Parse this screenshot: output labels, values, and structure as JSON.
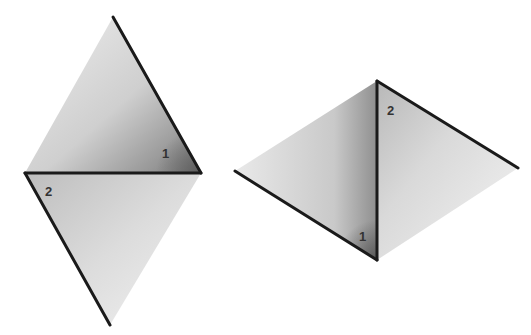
{
  "diagram": {
    "colors": {
      "edge": "#1a1a1a",
      "fill_light": "#e6e6e6",
      "fill_mid": "#c8c8c8",
      "fill_dark": "#8a8a8a",
      "label": "#333333"
    },
    "figures": [
      {
        "name": "left-rhombus",
        "vertices": {
          "top": [
            113,
            17
          ],
          "right": [
            201,
            173
          ],
          "left": [
            25,
            173
          ],
          "bottom": [
            110,
            325
          ]
        },
        "edges_drawn": [
          [
            [
              113,
              17
            ],
            [
              201,
              173
            ]
          ],
          [
            [
              25,
              173
            ],
            [
              201,
              173
            ]
          ],
          [
            [
              25,
              173
            ],
            [
              110,
              325
            ]
          ]
        ],
        "angle_labels": [
          {
            "text": "1",
            "x": 162,
            "y": 158
          },
          {
            "text": "2",
            "x": 45,
            "y": 196
          }
        ]
      },
      {
        "name": "right-rhombus",
        "vertices": {
          "top": [
            377,
            81
          ],
          "left": [
            235,
            171
          ],
          "right": [
            518,
            168
          ],
          "bottom": [
            377,
            260
          ]
        },
        "edges_drawn": [
          [
            [
              377,
              81
            ],
            [
              518,
              168
            ]
          ],
          [
            [
              377,
              81
            ],
            [
              377,
              260
            ]
          ],
          [
            [
              235,
              171
            ],
            [
              377,
              260
            ]
          ]
        ],
        "angle_labels": [
          {
            "text": "2",
            "x": 387,
            "y": 115
          },
          {
            "text": "1",
            "x": 359,
            "y": 241
          }
        ]
      }
    ]
  }
}
